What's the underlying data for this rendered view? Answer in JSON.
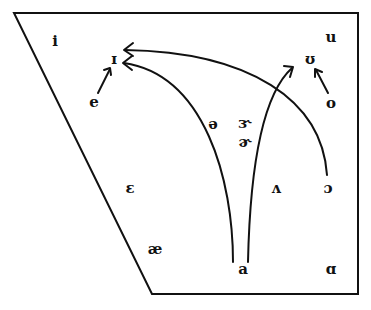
{
  "diagram": {
    "type": "vowel-quadrilateral",
    "stroke_color": "#111111",
    "background": "#ffffff",
    "outline": [
      [
        14,
        13
      ],
      [
        358,
        13
      ],
      [
        358,
        294
      ],
      [
        152,
        294
      ]
    ],
    "vowels": {
      "i": {
        "symbol": "i",
        "x": 55,
        "y": 42
      },
      "u": {
        "symbol": "u",
        "x": 331,
        "y": 38
      },
      "I": {
        "symbol": "ɪ",
        "x": 114,
        "y": 60
      },
      "U": {
        "symbol": "ʊ",
        "x": 310,
        "y": 60
      },
      "e": {
        "symbol": "e",
        "x": 94,
        "y": 103
      },
      "o": {
        "symbol": "o",
        "x": 331,
        "y": 104
      },
      "schwa": {
        "symbol": "ə",
        "x": 213,
        "y": 125
      },
      "rhotic_open": {
        "symbol": "ɝ",
        "x": 245,
        "y": 124
      },
      "rhotic_schwa": {
        "symbol": "ɚ",
        "x": 245,
        "y": 143
      },
      "epsilon": {
        "symbol": "ɛ",
        "x": 130,
        "y": 189
      },
      "wedge": {
        "symbol": "ʌ",
        "x": 276,
        "y": 189
      },
      "open_o": {
        "symbol": "ɔ",
        "x": 328,
        "y": 189
      },
      "ae": {
        "symbol": "æ",
        "x": 155,
        "y": 250
      },
      "a": {
        "symbol": "a",
        "x": 243,
        "y": 270
      },
      "script_a": {
        "symbol": "ɑ",
        "x": 331,
        "y": 270
      }
    },
    "arrows": [
      {
        "name": "e-to-I",
        "from": "e",
        "to": "ɪ"
      },
      {
        "name": "o-to-U",
        "from": "o",
        "to": "ʊ"
      },
      {
        "name": "a-to-I",
        "from": "a",
        "to": "ɪ"
      },
      {
        "name": "a-to-U",
        "from": "a",
        "to": "ʊ"
      },
      {
        "name": "open-o-to-I",
        "from": "ɔ",
        "to": "ɪ"
      }
    ]
  }
}
